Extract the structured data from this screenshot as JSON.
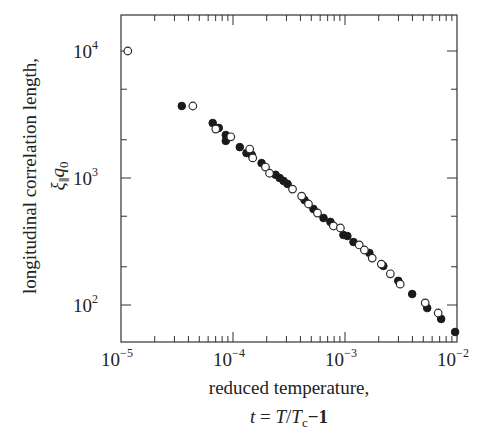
{
  "chart_data": {
    "type": "scatter",
    "title": "",
    "xlabel": "reduced temperature,",
    "xlabel_line2": "t = T/Tc−1",
    "ylabel": "longitudinal correlation length,",
    "ylabel_line2": "ξ∥q0",
    "xscale": "log",
    "yscale": "log",
    "xlim": [
      1e-05,
      0.01
    ],
    "ylim": [
      51,
      19000
    ],
    "grid": false,
    "legend": null,
    "x_ticks": [
      {
        "value": 1e-05,
        "base": "10",
        "exp": "−5"
      },
      {
        "value": 0.0001,
        "base": "10",
        "exp": "−4"
      },
      {
        "value": 0.001,
        "base": "10",
        "exp": "−3"
      },
      {
        "value": 0.01,
        "base": "10",
        "exp": "−2"
      }
    ],
    "y_ticks": [
      {
        "value": 100,
        "base": "10",
        "exp": "2"
      },
      {
        "value": 1000,
        "base": "10",
        "exp": "3"
      },
      {
        "value": 10000,
        "base": "10",
        "exp": "4"
      }
    ],
    "series": [
      {
        "name": "filled circles",
        "marker": "filled-circle",
        "points": [
          [
            3.49e-05,
            3690
          ],
          [
            6.59e-05,
            2710
          ],
          [
            7.46e-05,
            2480
          ],
          [
            8.62e-05,
            2180
          ],
          [
            8.62e-05,
            1960
          ],
          [
            0.000115,
            1750
          ],
          [
            0.000132,
            1570
          ],
          [
            0.000147,
            1520
          ],
          [
            0.00018,
            1310
          ],
          [
            0.00024,
            1060
          ],
          [
            0.000261,
            1000
          ],
          [
            0.000283,
            947
          ],
          [
            0.000307,
            897
          ],
          [
            0.000435,
            671
          ],
          [
            0.000523,
            570
          ],
          [
            0.000643,
            484
          ],
          [
            0.000741,
            451
          ],
          [
            0.000968,
            356
          ],
          [
            0.00105,
            349
          ],
          [
            0.00119,
            313
          ],
          [
            0.00165,
            257
          ],
          [
            0.0022,
            203
          ],
          [
            0.00299,
            155
          ],
          [
            0.00398,
            122
          ],
          [
            0.00542,
            94.6
          ],
          [
            0.00722,
            77.6
          ],
          [
            0.00962,
            61.3
          ]
        ]
      },
      {
        "name": "open circles",
        "marker": "open-circle",
        "points": [
          [
            1.15e-05,
            10000
          ],
          [
            4.38e-05,
            3690
          ],
          [
            7.02e-05,
            2430
          ],
          [
            9.55e-05,
            2110
          ],
          [
            0.000141,
            1690
          ],
          [
            0.00015,
            1440
          ],
          [
            0.000195,
            1220
          ],
          [
            0.000212,
            1090
          ],
          [
            0.00034,
            818
          ],
          [
            0.00041,
            720
          ],
          [
            0.000472,
            624
          ],
          [
            0.000568,
            530
          ],
          [
            0.000788,
            419
          ],
          [
            0.00091,
            404
          ],
          [
            0.00134,
            297
          ],
          [
            0.00149,
            271
          ],
          [
            0.00175,
            234
          ],
          [
            0.00211,
            210
          ],
          [
            0.00254,
            176
          ],
          [
            0.00311,
            146
          ],
          [
            0.0052,
            104
          ],
          [
            0.00679,
            86.5
          ]
        ]
      }
    ]
  },
  "labels": {
    "x_title_line1": "reduced temperature,",
    "x_title_t": "t",
    "x_title_eq": " = ",
    "x_title_T": "T",
    "x_title_slash": "/",
    "x_title_Tc": "T",
    "x_title_c": "c",
    "x_title_minus1": "−1",
    "y_title_line1": "longitudinal correlation length,",
    "y_title_xi": "ξ",
    "y_title_par": "∥",
    "y_title_q": "q",
    "y_title_0": "0"
  }
}
